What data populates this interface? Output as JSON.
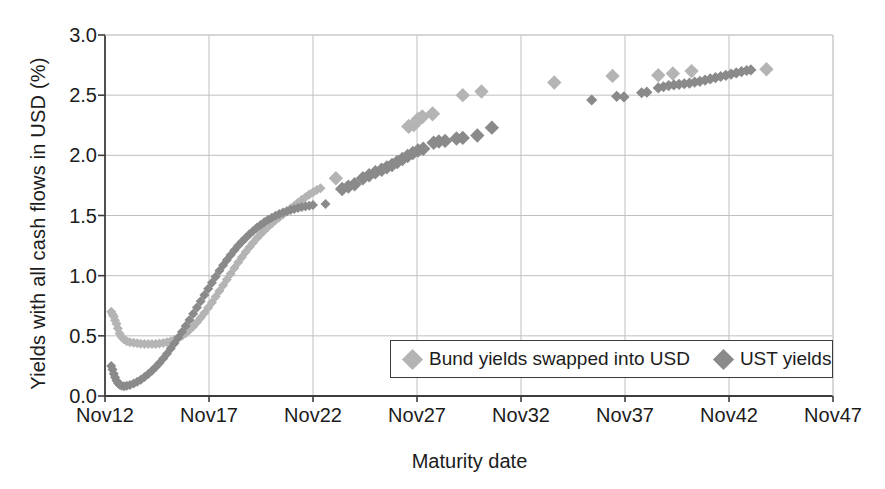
{
  "chart_data": {
    "type": "scatter",
    "title": "",
    "xlabel": "Maturity date",
    "ylabel": "Yields with all cash flows in USD (%)",
    "xtick_labels": [
      "Nov12",
      "Nov17",
      "Nov22",
      "Nov27",
      "Nov32",
      "Nov37",
      "Nov42",
      "Nov47"
    ],
    "xtick_values": [
      2012,
      2017,
      2022,
      2027,
      2032,
      2037,
      2042,
      2047
    ],
    "ytick_labels": [
      "0.0",
      "0.5",
      "1.0",
      "1.5",
      "2.0",
      "2.5",
      "3.0"
    ],
    "ytick_values": [
      0.0,
      0.5,
      1.0,
      1.5,
      2.0,
      2.5,
      3.0
    ],
    "xlim": [
      2012,
      2047
    ],
    "ylim": [
      0.0,
      3.0
    ],
    "grid": true,
    "legend_position": "lower-right-inside",
    "colors": {
      "bund": "#b4b4b4",
      "ust": "#8a8a8a",
      "axis": "#3d3d3d",
      "grid": "#bfbfbf",
      "text": "#1c1c1c"
    },
    "marker": "diamond",
    "series": [
      {
        "name": "Bund yields swapped into USD",
        "color": "#b4b4b4",
        "marker": "diamond",
        "points": [
          [
            2012.3,
            0.7
          ],
          [
            2012.36,
            0.68
          ],
          [
            2012.42,
            0.66
          ],
          [
            2012.48,
            0.63
          ],
          [
            2012.55,
            0.6
          ],
          [
            2012.62,
            0.56
          ],
          [
            2012.7,
            0.52
          ],
          [
            2012.8,
            0.49
          ],
          [
            2012.92,
            0.47
          ],
          [
            2013.05,
            0.455
          ],
          [
            2013.2,
            0.447
          ],
          [
            2013.38,
            0.442
          ],
          [
            2013.55,
            0.438
          ],
          [
            2013.72,
            0.435
          ],
          [
            2013.9,
            0.433
          ],
          [
            2014.08,
            0.432
          ],
          [
            2014.26,
            0.432
          ],
          [
            2014.44,
            0.433
          ],
          [
            2014.62,
            0.436
          ],
          [
            2014.8,
            0.44
          ],
          [
            2014.98,
            0.446
          ],
          [
            2015.16,
            0.455
          ],
          [
            2015.34,
            0.467
          ],
          [
            2015.52,
            0.482
          ],
          [
            2015.7,
            0.5
          ],
          [
            2015.88,
            0.522
          ],
          [
            2016.06,
            0.548
          ],
          [
            2016.24,
            0.578
          ],
          [
            2016.42,
            0.612
          ],
          [
            2016.6,
            0.65
          ],
          [
            2016.78,
            0.69
          ],
          [
            2016.96,
            0.733
          ],
          [
            2017.14,
            0.778
          ],
          [
            2017.32,
            0.824
          ],
          [
            2017.5,
            0.872
          ],
          [
            2017.68,
            0.92
          ],
          [
            2017.86,
            0.968
          ],
          [
            2018.04,
            1.016
          ],
          [
            2018.22,
            1.064
          ],
          [
            2018.4,
            1.11
          ],
          [
            2018.58,
            1.154
          ],
          [
            2018.76,
            1.196
          ],
          [
            2018.94,
            1.236
          ],
          [
            2019.12,
            1.274
          ],
          [
            2019.3,
            1.31
          ],
          [
            2019.48,
            1.344
          ],
          [
            2019.66,
            1.376
          ],
          [
            2019.84,
            1.406
          ],
          [
            2020.02,
            1.434
          ],
          [
            2020.2,
            1.46
          ],
          [
            2020.38,
            1.486
          ],
          [
            2020.56,
            1.51
          ],
          [
            2020.74,
            1.534
          ],
          [
            2020.92,
            1.558
          ],
          [
            2021.1,
            1.582
          ],
          [
            2021.28,
            1.606
          ],
          [
            2021.46,
            1.63
          ],
          [
            2021.64,
            1.652
          ],
          [
            2021.82,
            1.674
          ],
          [
            2022.0,
            1.694
          ],
          [
            2022.18,
            1.712
          ],
          [
            2022.36,
            1.726
          ],
          [
            2023.1,
            1.81
          ],
          [
            2026.6,
            2.24
          ],
          [
            2026.85,
            2.255
          ],
          [
            2027.05,
            2.3
          ],
          [
            2027.25,
            2.32
          ],
          [
            2027.75,
            2.345
          ],
          [
            2029.2,
            2.5
          ],
          [
            2030.1,
            2.53
          ],
          [
            2033.6,
            2.605
          ],
          [
            2036.4,
            2.66
          ],
          [
            2038.6,
            2.665
          ],
          [
            2039.3,
            2.68
          ],
          [
            2040.2,
            2.7
          ],
          [
            2043.8,
            2.715
          ]
        ]
      },
      {
        "name": "UST yields",
        "color": "#8a8a8a",
        "marker": "diamond",
        "points": [
          [
            2012.3,
            0.25
          ],
          [
            2012.36,
            0.22
          ],
          [
            2012.42,
            0.185
          ],
          [
            2012.48,
            0.155
          ],
          [
            2012.55,
            0.128
          ],
          [
            2012.62,
            0.108
          ],
          [
            2012.7,
            0.094
          ],
          [
            2012.8,
            0.085
          ],
          [
            2012.92,
            0.082
          ],
          [
            2013.05,
            0.085
          ],
          [
            2013.2,
            0.092
          ],
          [
            2013.38,
            0.103
          ],
          [
            2013.55,
            0.118
          ],
          [
            2013.72,
            0.136
          ],
          [
            2013.9,
            0.157
          ],
          [
            2014.08,
            0.182
          ],
          [
            2014.26,
            0.21
          ],
          [
            2014.44,
            0.241
          ],
          [
            2014.62,
            0.275
          ],
          [
            2014.8,
            0.312
          ],
          [
            2014.98,
            0.352
          ],
          [
            2015.16,
            0.394
          ],
          [
            2015.34,
            0.438
          ],
          [
            2015.52,
            0.484
          ],
          [
            2015.7,
            0.532
          ],
          [
            2015.88,
            0.582
          ],
          [
            2016.06,
            0.632
          ],
          [
            2016.24,
            0.684
          ],
          [
            2016.42,
            0.736
          ],
          [
            2016.6,
            0.788
          ],
          [
            2016.78,
            0.84
          ],
          [
            2016.96,
            0.892
          ],
          [
            2017.14,
            0.942
          ],
          [
            2017.32,
            0.992
          ],
          [
            2017.5,
            1.04
          ],
          [
            2017.68,
            1.086
          ],
          [
            2017.86,
            1.13
          ],
          [
            2018.04,
            1.172
          ],
          [
            2018.22,
            1.212
          ],
          [
            2018.4,
            1.248
          ],
          [
            2018.58,
            1.282
          ],
          [
            2018.76,
            1.314
          ],
          [
            2018.94,
            1.344
          ],
          [
            2019.12,
            1.372
          ],
          [
            2019.3,
            1.398
          ],
          [
            2019.48,
            1.422
          ],
          [
            2019.66,
            1.444
          ],
          [
            2019.84,
            1.464
          ],
          [
            2020.02,
            1.482
          ],
          [
            2020.2,
            1.498
          ],
          [
            2020.38,
            1.512
          ],
          [
            2020.56,
            1.524
          ],
          [
            2020.74,
            1.535
          ],
          [
            2020.92,
            1.545
          ],
          [
            2021.1,
            1.554
          ],
          [
            2021.28,
            1.562
          ],
          [
            2021.46,
            1.57
          ],
          [
            2021.64,
            1.576
          ],
          [
            2021.82,
            1.582
          ],
          [
            2022.0,
            1.588
          ],
          [
            2022.6,
            1.595
          ],
          [
            2023.4,
            1.72
          ],
          [
            2023.7,
            1.74
          ],
          [
            2024.0,
            1.76
          ],
          [
            2024.4,
            1.81
          ],
          [
            2024.7,
            1.835
          ],
          [
            2025.0,
            1.86
          ],
          [
            2025.3,
            1.88
          ],
          [
            2025.55,
            1.9
          ],
          [
            2025.8,
            1.92
          ],
          [
            2026.05,
            1.945
          ],
          [
            2026.3,
            1.97
          ],
          [
            2026.55,
            1.995
          ],
          [
            2026.8,
            2.02
          ],
          [
            2027.05,
            2.04
          ],
          [
            2027.3,
            2.055
          ],
          [
            2027.8,
            2.105
          ],
          [
            2028.05,
            2.115
          ],
          [
            2028.35,
            2.12
          ],
          [
            2028.9,
            2.14
          ],
          [
            2029.2,
            2.145
          ],
          [
            2029.9,
            2.165
          ],
          [
            2030.6,
            2.23
          ],
          [
            2035.4,
            2.46
          ],
          [
            2036.6,
            2.49
          ],
          [
            2036.95,
            2.485
          ],
          [
            2037.8,
            2.52
          ],
          [
            2038.05,
            2.525
          ],
          [
            2038.6,
            2.56
          ],
          [
            2038.85,
            2.57
          ],
          [
            2039.1,
            2.58
          ],
          [
            2039.35,
            2.585
          ],
          [
            2039.6,
            2.59
          ],
          [
            2039.85,
            2.595
          ],
          [
            2040.1,
            2.6
          ],
          [
            2040.35,
            2.608
          ],
          [
            2040.6,
            2.615
          ],
          [
            2040.85,
            2.625
          ],
          [
            2041.1,
            2.635
          ],
          [
            2041.35,
            2.645
          ],
          [
            2041.6,
            2.655
          ],
          [
            2041.85,
            2.665
          ],
          [
            2042.1,
            2.675
          ],
          [
            2042.35,
            2.685
          ],
          [
            2042.6,
            2.695
          ],
          [
            2042.85,
            2.705
          ],
          [
            2043.05,
            2.71
          ]
        ]
      }
    ]
  },
  "legend": {
    "entries": [
      {
        "label": "Bund yields swapped into USD",
        "color": "#b4b4b4"
      },
      {
        "label": "UST yields",
        "color": "#8a8a8a"
      }
    ]
  },
  "ghost_top_text": ""
}
